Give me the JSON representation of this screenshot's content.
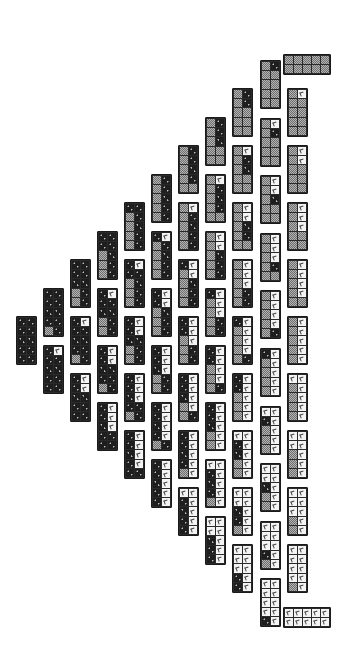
{
  "diagram": {
    "title": "",
    "cell_types": {
      "d": "dark-dotted",
      "g": "gray-checkered",
      "w": "white-marked"
    },
    "colors": {
      "dark": "#1e1e1e",
      "gray": "#9a9a9a",
      "white": "#f4f4f4",
      "border": "#1a1a1a"
    },
    "block_size": {
      "vertical": [
        21,
        49
      ],
      "horizontal": [
        48,
        21
      ]
    },
    "columns": [
      {
        "k": 0,
        "x": 16,
        "top": 316,
        "step": 57,
        "blocks": 1
      },
      {
        "k": 1,
        "x": 43,
        "top": 288,
        "step": 57,
        "blocks": 2
      },
      {
        "k": 2,
        "x": 70,
        "top": 259,
        "step": 57,
        "blocks": 3
      },
      {
        "k": 3,
        "x": 97,
        "top": 231,
        "step": 57,
        "blocks": 4
      },
      {
        "k": 4,
        "x": 124,
        "top": 202,
        "step": 57,
        "blocks": 5
      },
      {
        "k": 5,
        "x": 151,
        "top": 174,
        "step": 57,
        "blocks": 6
      },
      {
        "k": 6,
        "x": 178,
        "top": 145,
        "step": 57,
        "blocks": 7
      },
      {
        "k": 7,
        "x": 205,
        "top": 117,
        "step": 57,
        "blocks": 8
      },
      {
        "k": 8,
        "x": 232,
        "top": 88,
        "step": 57,
        "blocks": 9
      },
      {
        "k": 9,
        "x": 260,
        "top": 60,
        "step": 57.6,
        "blocks": 10
      },
      {
        "k": 10,
        "x": 287,
        "top": 88,
        "step": 57,
        "blocks": 9,
        "j_start": 1
      }
    ],
    "horizontal_blocks": [
      {
        "name": "top-all-gray-block",
        "x": 283,
        "y": 54,
        "fill": "g"
      },
      {
        "name": "bottom-all-white-block",
        "x": 283,
        "y": 607,
        "fill": "w"
      }
    ]
  }
}
